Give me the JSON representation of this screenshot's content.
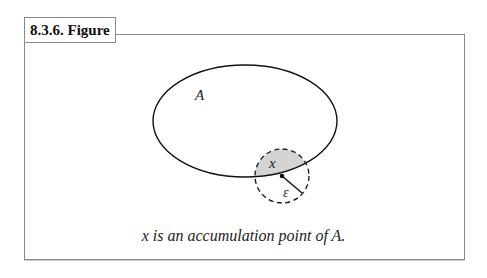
{
  "figure": {
    "title": "8.3.6. Figure",
    "caption": "x is an accumulation point of A.",
    "labels": {
      "set": "A",
      "point": "x",
      "radius": "ε"
    },
    "colors": {
      "border": "#8a8a8a",
      "stroke": "#111111",
      "fill": "#d4d4d4"
    }
  }
}
